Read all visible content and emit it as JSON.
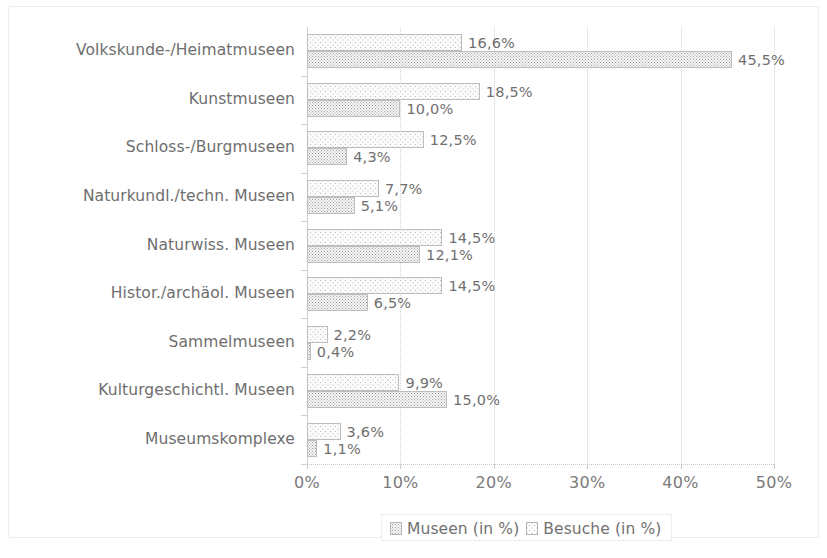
{
  "chart_data": {
    "type": "bar",
    "orientation": "horizontal",
    "title": "",
    "subtitle": "",
    "xlabel": "",
    "ylabel": "",
    "xlim": [
      0,
      50
    ],
    "xunit": "%",
    "grid": true,
    "grid_axis": "x",
    "legend_position": "bottom-center",
    "decimal_separator": ",",
    "categories": [
      "Volkskunde-/Heimatmuseen",
      "Kunstmuseen",
      "Schloss-/Burgmuseen",
      "Naturkundl./techn. Museen",
      "Naturwiss. Museen",
      "Histor./archäol. Museen",
      "Sammelmuseen",
      "Kulturgeschichtl. Museen",
      "Museumskomplexe"
    ],
    "x_tick_values": [
      0,
      10,
      20,
      30,
      40,
      50
    ],
    "x_tick_labels": [
      "0%",
      "10%",
      "20%",
      "30%",
      "40%",
      "50%"
    ],
    "series": [
      {
        "name": "Museen (in %)",
        "pattern": "dotted-sparse",
        "values": [
          16.6,
          18.5,
          12.5,
          7.7,
          14.5,
          14.5,
          2.2,
          9.9,
          3.6
        ],
        "labels": [
          "16,6%",
          "18,5%",
          "12,5%",
          "7,7%",
          "14,5%",
          "14,5%",
          "2,2%",
          "9,9%",
          "3,6%"
        ]
      },
      {
        "name": "Besuche (in %)",
        "pattern": "dotted-dense",
        "values": [
          45.5,
          10.0,
          4.3,
          5.1,
          12.1,
          6.5,
          0.4,
          15.0,
          1.1
        ],
        "labels": [
          "45,5%",
          "10,0%",
          "4,3%",
          "5,1%",
          "12,1%",
          "6,5%",
          "0,4%",
          "15,0%",
          "1,1%"
        ]
      }
    ]
  },
  "legend": {
    "entries": [
      {
        "label": "Museen (in %)",
        "swatch": "museen-swatch-icon"
      },
      {
        "label": "Besuche (in %)",
        "swatch": "besuche-swatch-icon"
      }
    ]
  },
  "colors": {
    "background": "#ffffff",
    "frame_border": "#ededed",
    "gridline": "#d2d2d2",
    "axis": "#c9c9c9",
    "text": "#6f6f6f",
    "series_museen_dot": "#b9b9b9",
    "series_besuche_dot": "#9e9e9e"
  }
}
